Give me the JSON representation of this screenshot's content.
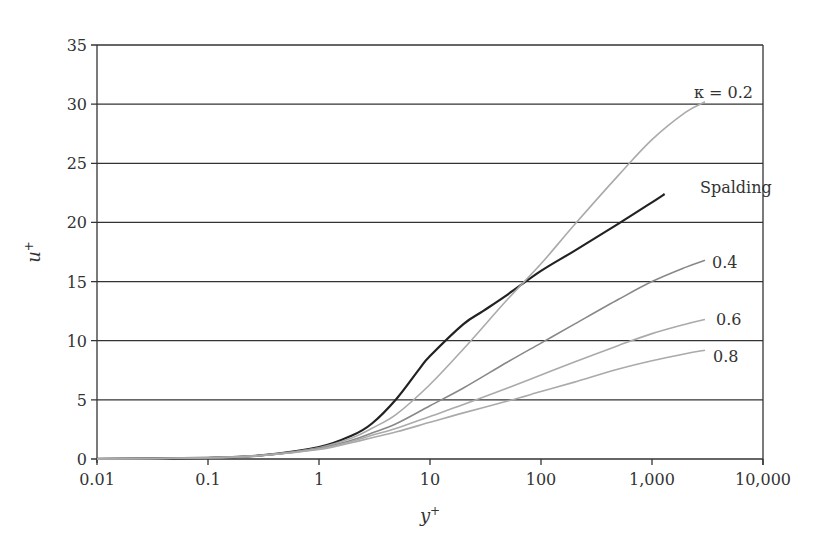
{
  "chart_data": {
    "type": "line",
    "title": "",
    "xlabel": "y+",
    "ylabel": "u+",
    "xscale": "log",
    "xlim": [
      0.01,
      10000
    ],
    "ylim": [
      0,
      35
    ],
    "grid": {
      "horizontal": true,
      "vertical": false
    },
    "legend": "inline labels at curve ends",
    "x_ticks": [
      "0.01",
      "0.1",
      "1",
      "10",
      "100",
      "1,000",
      "10,000"
    ],
    "y_ticks": [
      "0",
      "5",
      "10",
      "15",
      "20",
      "25",
      "30",
      "35"
    ],
    "series": [
      {
        "name": "Spalding",
        "label": "Spalding",
        "color": "#222222",
        "x": [
          0.01,
          0.1,
          0.3,
          1,
          2,
          3,
          5,
          8,
          10,
          20,
          30,
          50,
          100,
          200,
          500,
          1000,
          1300
        ],
        "y": [
          0.01,
          0.1,
          0.3,
          1.0,
          2.0,
          3.0,
          5.1,
          7.6,
          8.7,
          11.4,
          12.5,
          13.9,
          15.9,
          17.6,
          19.9,
          21.7,
          22.4
        ]
      },
      {
        "name": "kappa = 0.2",
        "label": "κ = 0.2",
        "color": "#aaaaaa",
        "x": [
          0.01,
          0.1,
          0.3,
          1,
          2,
          3,
          5,
          10,
          20,
          50,
          100,
          200,
          500,
          1000,
          2000,
          3000
        ],
        "y": [
          0.01,
          0.1,
          0.3,
          0.95,
          1.8,
          2.6,
          3.8,
          6.3,
          9.3,
          13.5,
          16.5,
          19.8,
          24.0,
          27.0,
          29.3,
          30.2
        ]
      },
      {
        "name": "0.4",
        "label": "0.4",
        "color": "#888888",
        "x": [
          0.01,
          0.1,
          0.3,
          1,
          2,
          3,
          5,
          10,
          20,
          50,
          100,
          200,
          500,
          1000,
          2000,
          3000
        ],
        "y": [
          0.01,
          0.1,
          0.3,
          0.9,
          1.6,
          2.2,
          3.0,
          4.5,
          6.0,
          8.2,
          9.8,
          11.4,
          13.5,
          15.0,
          16.2,
          16.8
        ]
      },
      {
        "name": "0.6",
        "label": "0.6",
        "color": "#aaaaaa",
        "x": [
          0.01,
          0.1,
          0.3,
          1,
          2,
          3,
          5,
          10,
          20,
          50,
          100,
          200,
          500,
          1000,
          2000,
          3000
        ],
        "y": [
          0.01,
          0.1,
          0.3,
          0.85,
          1.5,
          2.0,
          2.6,
          3.6,
          4.6,
          6.0,
          7.1,
          8.2,
          9.6,
          10.6,
          11.4,
          11.8
        ]
      },
      {
        "name": "0.8",
        "label": "0.8",
        "color": "#aaaaaa",
        "x": [
          0.01,
          0.1,
          0.3,
          1,
          2,
          3,
          5,
          10,
          20,
          50,
          100,
          200,
          500,
          1000,
          2000,
          3000
        ],
        "y": [
          0.01,
          0.1,
          0.3,
          0.8,
          1.4,
          1.8,
          2.3,
          3.1,
          3.9,
          4.9,
          5.7,
          6.5,
          7.6,
          8.3,
          8.9,
          9.2
        ]
      }
    ]
  },
  "axes": {
    "x_title": "y",
    "x_title_sup": "+",
    "y_title": "u",
    "y_title_sup": "+"
  }
}
